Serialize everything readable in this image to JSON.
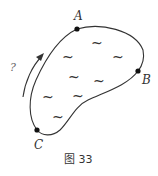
{
  "figure": {
    "caption": "图 33",
    "question_mark": "?",
    "points": [
      {
        "label": "A",
        "x": 77,
        "y": 29
      },
      {
        "label": "B",
        "x": 138,
        "y": 71
      },
      {
        "label": "C",
        "x": 37,
        "y": 130
      }
    ],
    "region_fill_symbol": "~",
    "tilde_positions": [
      [
        68,
        58
      ],
      [
        97,
        44
      ],
      [
        118,
        58
      ],
      [
        74,
        78
      ],
      [
        99,
        82
      ],
      [
        48,
        98
      ],
      [
        78,
        97
      ],
      [
        58,
        118
      ]
    ],
    "arrow": {
      "direction": "up-along-left-boundary",
      "from": [
        23,
        97
      ],
      "to": [
        43,
        55
      ]
    },
    "colors": {
      "stroke": "#333333",
      "background": "#ffffff"
    }
  }
}
